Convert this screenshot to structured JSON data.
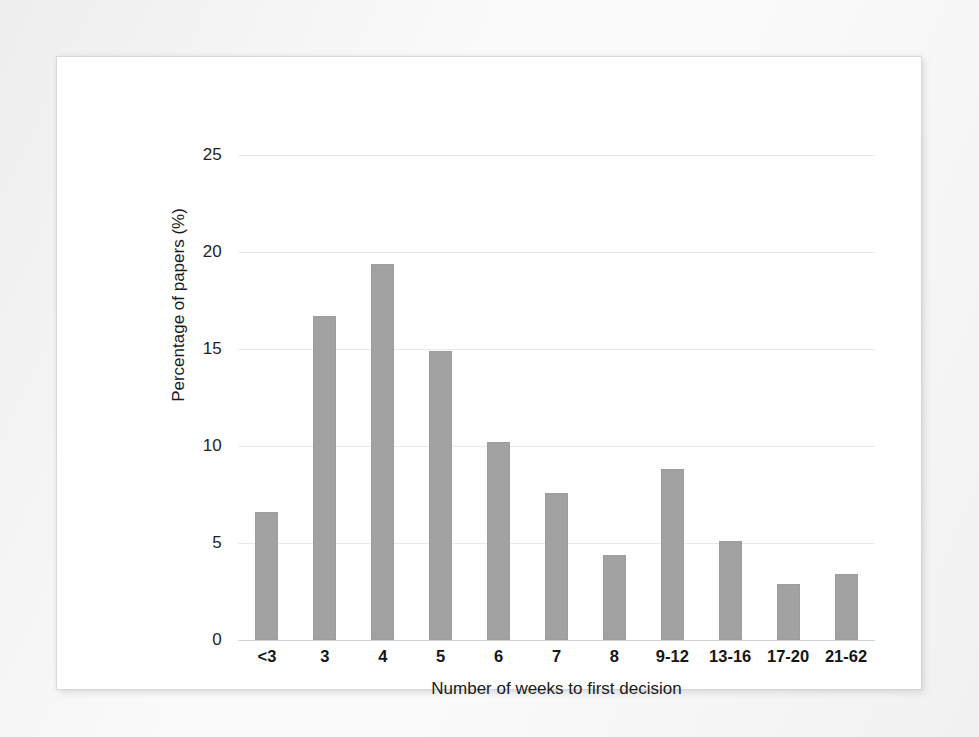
{
  "chart_data": {
    "type": "bar",
    "title": "",
    "subtitle": "",
    "xlabel": "Number of weeks to first decision",
    "ylabel": "Percentage of papers (%)",
    "categories": [
      "<3",
      "3",
      "4",
      "5",
      "6",
      "7",
      "8",
      "9-12",
      "13-16",
      "17-20",
      "21-62"
    ],
    "values": [
      6.6,
      16.7,
      19.4,
      14.9,
      10.2,
      7.6,
      4.4,
      8.8,
      5.1,
      2.9,
      3.4
    ],
    "ylim": [
      0,
      25
    ],
    "ytick_labels": [
      "0",
      "5",
      "10",
      "15",
      "20",
      "25"
    ],
    "ytick_values": [
      0,
      5,
      10,
      15,
      20,
      25
    ],
    "grid": "horizontal",
    "legend": "none",
    "bar_color": "#a2a2a2",
    "gridline_color": "#e9e9e9",
    "axis_color": "#d3d3d3",
    "background_color": "#ffffff"
  }
}
